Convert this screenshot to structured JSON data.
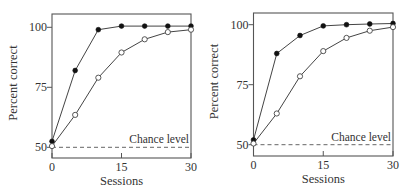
{
  "chart_data": [
    {
      "type": "line",
      "title": "",
      "xlabel": "Sessions",
      "ylabel": "Percent correct",
      "xlim": [
        0,
        30
      ],
      "ylim": [
        50,
        100
      ],
      "xticks": [
        0,
        15,
        30
      ],
      "yticks": [
        50,
        75,
        100
      ],
      "grid": false,
      "legend": null,
      "annotations": [
        {
          "text": "Chance level",
          "y": 50,
          "style": "dashed"
        }
      ],
      "x": [
        0,
        5,
        10,
        15,
        20,
        25,
        30
      ],
      "series": [
        {
          "name": "filled",
          "marker": "filled-circle",
          "values": [
            52.5,
            82,
            99,
            100.5,
            100.5,
            100.5,
            100.5
          ]
        },
        {
          "name": "open",
          "marker": "open-circle",
          "values": [
            50.5,
            63.5,
            79,
            89.5,
            95,
            98,
            99
          ]
        }
      ]
    },
    {
      "type": "line",
      "title": "",
      "xlabel": "Sessions",
      "ylabel": "Percent correct",
      "xlim": [
        0,
        30
      ],
      "ylim": [
        50,
        100
      ],
      "xticks": [
        0,
        15,
        30
      ],
      "yticks": [
        50,
        75,
        100
      ],
      "grid": false,
      "legend": null,
      "annotations": [
        {
          "text": "Chance level",
          "y": 50,
          "style": "dashed"
        }
      ],
      "x": [
        0,
        5,
        10,
        15,
        20,
        25,
        30
      ],
      "series": [
        {
          "name": "filled",
          "marker": "filled-circle",
          "values": [
            52,
            88,
            95.5,
            99.5,
            100,
            100.3,
            100.5
          ]
        },
        {
          "name": "open",
          "marker": "open-circle",
          "values": [
            50.5,
            63,
            78.5,
            89,
            94.5,
            97.5,
            99
          ]
        }
      ]
    }
  ],
  "panels": [
    {
      "ylabel": "Percent correct",
      "xlabel": "Sessions",
      "chance_label": "Chance level",
      "xtick_labels": [
        "0",
        "15",
        "30"
      ],
      "ytick_labels": [
        "50",
        "75",
        "100"
      ]
    },
    {
      "ylabel": "Percent correct",
      "xlabel": "Sessions",
      "chance_label": "Chance level",
      "xtick_labels": [
        "0",
        "15",
        "30"
      ],
      "ytick_labels": [
        "50",
        "75",
        "100"
      ]
    }
  ],
  "colors": {
    "line": "#444444",
    "frame": "#555555",
    "marker_fill": "#111111",
    "open_fill": "#ffffff",
    "dash": "#666666"
  }
}
